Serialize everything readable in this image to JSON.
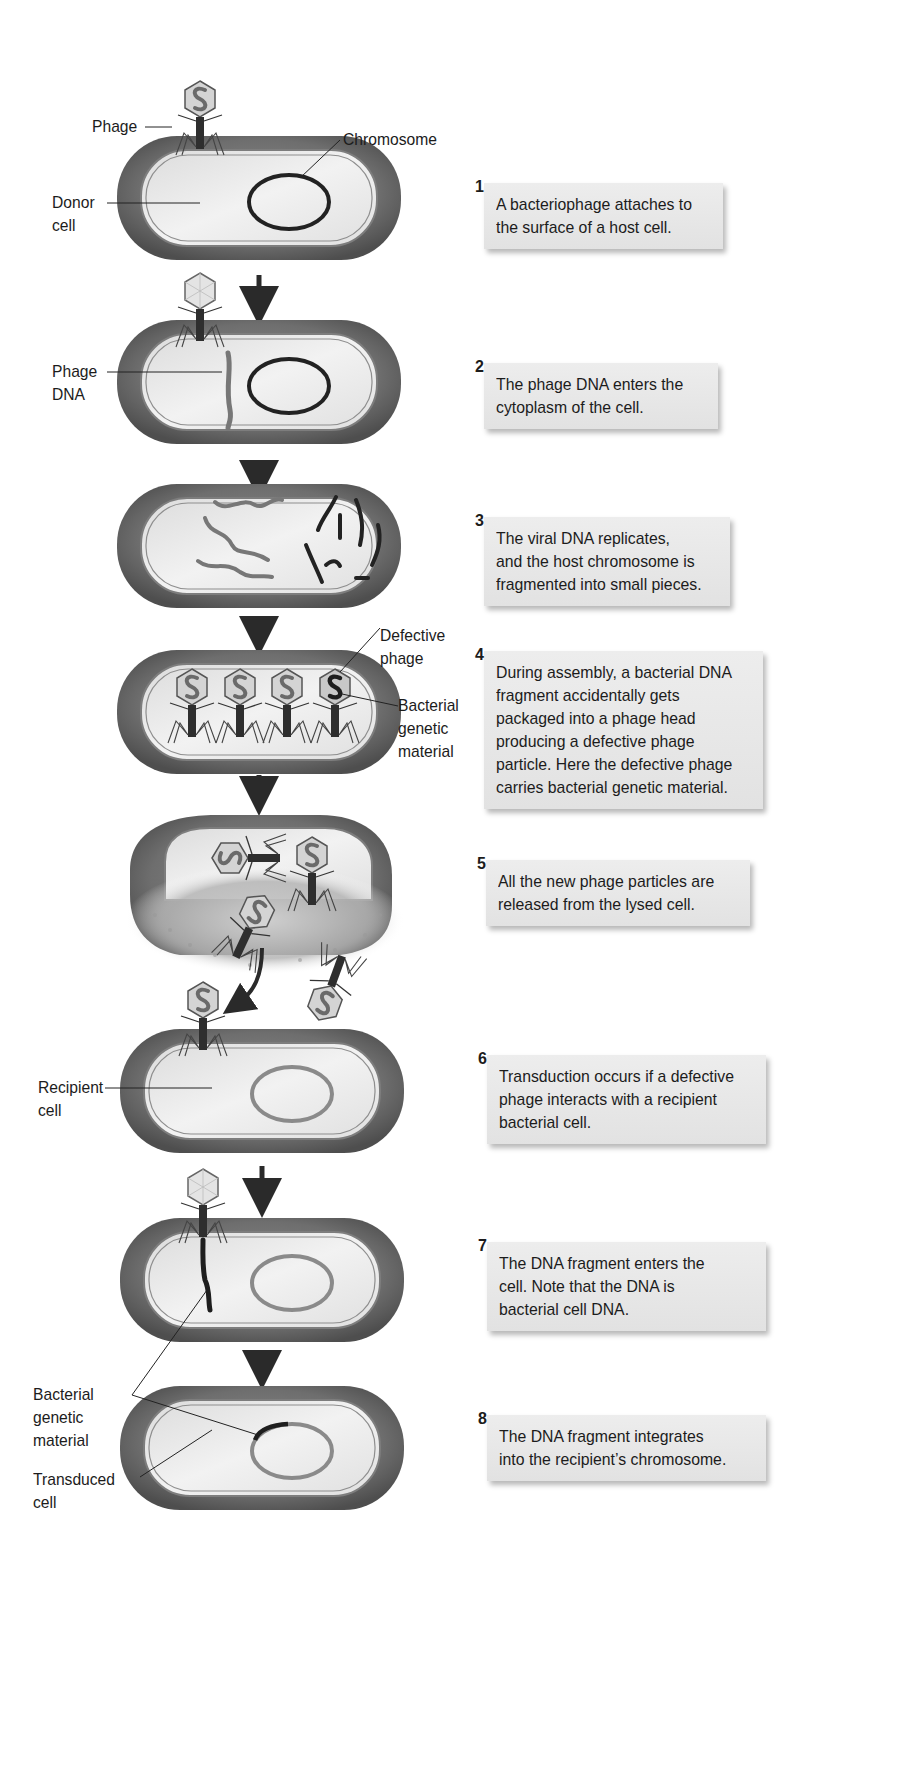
{
  "diagram": {
    "type": "process-flow",
    "colors": {
      "cell_wall": "#6b6b6b",
      "cytoplasm": "#e6e6e6",
      "host_chromosome": "#222222",
      "recipient_chromosome": "#8a8a8a",
      "viral_dna": "#7a7a7a",
      "caption_bg": "#e8e8e8",
      "arrow": "#2a2a2a"
    },
    "labels": {
      "phage": "Phage",
      "chromosome": "Chromosome",
      "donor_cell": "Donor\ncell",
      "phage_dna": "Phage\nDNA",
      "defective_phage": "Defective\nphage",
      "bacterial_genetic_material_4": "Bacterial\ngenetic\nmaterial",
      "recipient_cell": "Recipient\ncell",
      "bacterial_genetic_material_7": "Bacterial\ngenetic\nmaterial",
      "transduced_cell": "Transduced\ncell"
    },
    "steps": [
      {
        "number": "1",
        "text": "A bacteriophage attaches to\nthe surface of a host cell."
      },
      {
        "number": "2",
        "text": "The phage DNA enters the\ncytoplasm of the cell."
      },
      {
        "number": "3",
        "text": "The viral DNA replicates,\nand the host chromosome is\nfragmented into small pieces."
      },
      {
        "number": "4",
        "text": "During assembly, a bacterial DNA\nfragment accidentally gets\npackaged into a phage head\nproducing a defective phage\nparticle. Here the defective phage\ncarries bacterial genetic material."
      },
      {
        "number": "5",
        "text": "All the new phage particles are\nreleased from the lysed cell."
      },
      {
        "number": "6",
        "text": "Transduction occurs if a defective\nphage interacts with a recipient\nbacterial cell."
      },
      {
        "number": "7",
        "text": "The DNA fragment enters the\ncell. Note that the DNA is\nbacterial cell DNA."
      },
      {
        "number": "8",
        "text": "The DNA fragment integrates\ninto the recipient’s chromosome."
      }
    ]
  }
}
